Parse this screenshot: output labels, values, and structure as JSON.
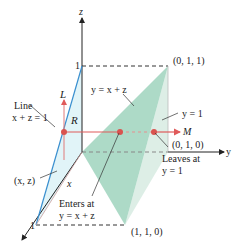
{
  "diagram": {
    "axes": {
      "x": "x",
      "y": "y",
      "z": "z"
    },
    "ticks": {
      "z_one": "1",
      "x_one": "1"
    },
    "points": {
      "p011": "(0, 1, 1)",
      "p010": "(0, 1, 0)",
      "p110": "(1, 1, 0)",
      "pxz": "(x, z)"
    },
    "labels": {
      "plane_yxz": "y = x + z",
      "plane_y1": "y = 1",
      "line_title": "Line",
      "line_eq": "x + z = 1",
      "L": "L",
      "R": "R",
      "x_small": "x",
      "M": "M",
      "enters_1": "Enters at",
      "enters_2": "y = x + z",
      "leaves_1": "Leaves at",
      "leaves_2": "y = 1"
    },
    "colors": {
      "green_face": "#8fcfb5",
      "green_face_light": "#cfe7dc",
      "blue_region": "#dff3f8",
      "blue_line": "#3a8fcf",
      "red_line": "#e05a5a",
      "axis": "#222222"
    }
  }
}
